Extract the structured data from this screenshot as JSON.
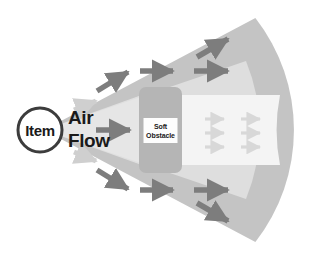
{
  "diagram": {
    "type": "airflow-schematic",
    "canvas": {
      "width": 331,
      "height": 265
    },
    "background_color": "#ffffff",
    "colors": {
      "cone_outer": "#c4c4c4",
      "cone_inner": "#dedede",
      "wake_band": "#f2f2f2",
      "obstacle_fill": "#b5b5b5",
      "obstacle_label_fill": "#fdfdfd",
      "arrow_dark": "#7d7d7d",
      "arrow_light": "#cfcfcf",
      "arrow_wake": "#d8d8d8",
      "text": "#1a1a1a",
      "item_ring": "#3c3c3c"
    },
    "item": {
      "label": "Item",
      "shape": "circle",
      "cx": 40,
      "cy": 130,
      "r": 22
    },
    "airflow_label": {
      "line1": "Air",
      "line2": "Flow",
      "x": 68,
      "y1": 124,
      "y2": 147
    },
    "obstacle": {
      "label_line1": "Soft",
      "label_line2": "Obstacle",
      "x": 139,
      "y": 87,
      "width": 43,
      "height": 86,
      "corner_radius": 7
    },
    "cone": {
      "apex_x": 44,
      "apex_y": 130,
      "arc_center_x": 112,
      "arc_radius": 182,
      "half_angle_deg": 38
    },
    "wake": {
      "x": 182,
      "y": 95,
      "width": 112,
      "height": 70,
      "description": "low-velocity shadow region downstream of obstacle"
    },
    "arrows": {
      "upstream_dark": [
        {
          "name": "upstream-upper-diagonal",
          "x": 95,
          "y": 83,
          "angle": -33,
          "length": 30,
          "color": "dark"
        },
        {
          "name": "upstream-center",
          "x": 93,
          "y": 130,
          "angle": 0,
          "length": 33,
          "color": "dark"
        },
        {
          "name": "upstream-lower-diagonal",
          "x": 95,
          "y": 178,
          "angle": 33,
          "length": 30,
          "color": "dark"
        }
      ],
      "upstream_light": [
        {
          "name": "upstream-light-upper",
          "x": 82,
          "y": 105,
          "angle": -20,
          "length": 22,
          "color": "light"
        },
        {
          "name": "upstream-light-lower",
          "x": 82,
          "y": 156,
          "angle": 20,
          "length": 22,
          "color": "light"
        }
      ],
      "bypass_dark": [
        {
          "name": "bypass-top-inner",
          "x": 139,
          "y": 71,
          "angle": 0,
          "length": 33,
          "color": "dark"
        },
        {
          "name": "bypass-top-outer",
          "x": 193,
          "y": 70,
          "angle": 0,
          "length": 33,
          "color": "dark"
        },
        {
          "name": "bypass-top-rise",
          "x": 196,
          "y": 48,
          "angle": -33,
          "length": 30,
          "color": "dark"
        },
        {
          "name": "bypass-bottom-inner",
          "x": 139,
          "y": 190,
          "angle": 0,
          "length": 33,
          "color": "dark"
        },
        {
          "name": "bypass-bottom-outer",
          "x": 193,
          "y": 190,
          "angle": 0,
          "length": 33,
          "color": "dark"
        },
        {
          "name": "bypass-bottom-fall",
          "x": 196,
          "y": 208,
          "angle": 33,
          "length": 30,
          "color": "dark"
        }
      ],
      "wake_light": [
        {
          "name": "wake-arrow-r1c1",
          "x": 210,
          "y": 119,
          "angle": 0,
          "length": 22,
          "color": "wake"
        },
        {
          "name": "wake-arrow-r1c2",
          "x": 246,
          "y": 119,
          "angle": 0,
          "length": 22,
          "color": "wake"
        },
        {
          "name": "wake-arrow-r2c1",
          "x": 210,
          "y": 133,
          "angle": 0,
          "length": 22,
          "color": "wake"
        },
        {
          "name": "wake-arrow-r2c2",
          "x": 246,
          "y": 133,
          "angle": 0,
          "length": 22,
          "color": "wake"
        },
        {
          "name": "wake-arrow-r3c1",
          "x": 210,
          "y": 147,
          "angle": 0,
          "length": 22,
          "color": "wake"
        },
        {
          "name": "wake-arrow-r3c2",
          "x": 246,
          "y": 147,
          "angle": 0,
          "length": 22,
          "color": "wake"
        }
      ]
    }
  }
}
